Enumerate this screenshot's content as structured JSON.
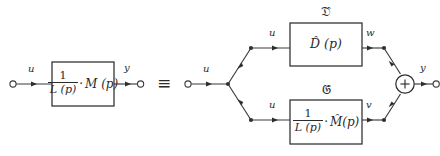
{
  "figure": {
    "type": "block-diagram",
    "equivalence_symbol": "≡",
    "ink_color": "#2e2e2e",
    "background_color": "#ffffff"
  },
  "left_diagram": {
    "input_label": "u",
    "output_label": "y",
    "block": {
      "numerator": "1",
      "denominator": "L (p)",
      "operator": "·",
      "factor": "M (p)"
    }
  },
  "right_diagram": {
    "input_label": "u",
    "output_label": "y",
    "branch_input_top_label": "u",
    "branch_input_bottom_label": "u",
    "top_branch": {
      "caption": "𝔇̂",
      "caption_fallback": "D",
      "block_text": "D̂ (p)",
      "output_label": "w"
    },
    "bottom_branch": {
      "caption": "𝔊̂",
      "caption_fallback": "G",
      "block": {
        "numerator": "1",
        "denominator": "L (p)",
        "operator": "·",
        "factor": "M̂(p)"
      },
      "output_label": "v"
    },
    "summer": {
      "sign": "+"
    }
  }
}
